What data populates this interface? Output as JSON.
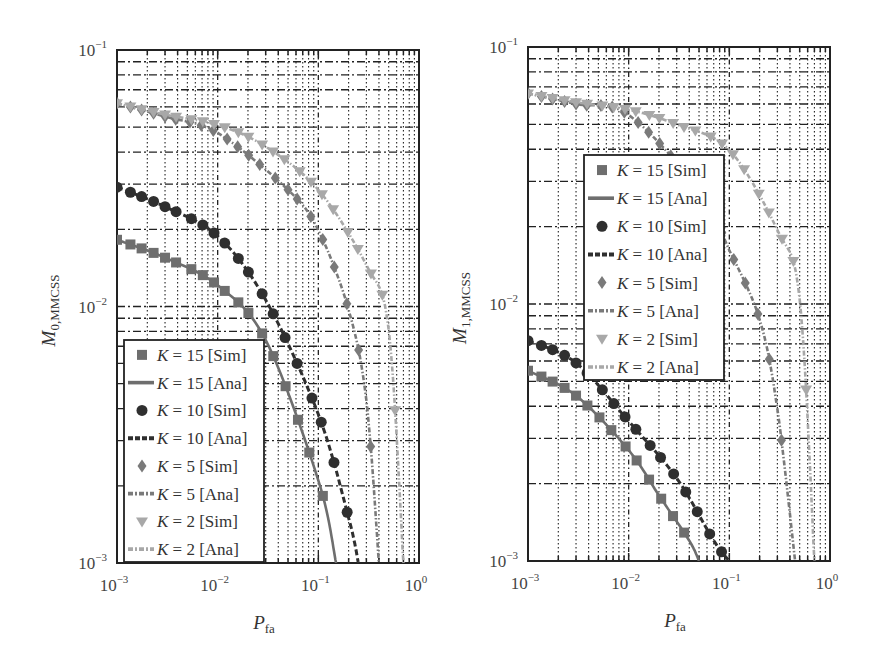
{
  "figure": {
    "panels": [
      {
        "id": "left",
        "ylabel_main": "M",
        "ylabel_sub": "0,MMCSS",
        "xlabel_main": "P",
        "xlabel_sub": "fa",
        "x_ticks": [
          {
            "base": "10",
            "exp": "−3"
          },
          {
            "base": "10",
            "exp": "−2"
          },
          {
            "base": "10",
            "exp": "−1"
          },
          {
            "base": "10",
            "exp": "0"
          }
        ],
        "y_ticks": [
          {
            "base": "10",
            "exp": "−1"
          },
          {
            "base": "10",
            "exp": "−2"
          },
          {
            "base": "10",
            "exp": "−3"
          }
        ]
      },
      {
        "id": "right",
        "ylabel_main": "M",
        "ylabel_sub": "1,MMCSS",
        "xlabel_main": "P",
        "xlabel_sub": "fa",
        "x_ticks": [
          {
            "base": "10",
            "exp": "−3"
          },
          {
            "base": "10",
            "exp": "−2"
          },
          {
            "base": "10",
            "exp": "−1"
          },
          {
            "base": "10",
            "exp": "0"
          }
        ],
        "y_ticks": [
          {
            "base": "10",
            "exp": "−1"
          },
          {
            "base": "10",
            "exp": "−2"
          },
          {
            "base": "10",
            "exp": "−3"
          }
        ]
      }
    ],
    "legend": [
      {
        "k": "K",
        "eq": " = 15 [Sim]",
        "marker": "square",
        "color": "#6e6e6e"
      },
      {
        "k": "K",
        "eq": " = 15 [Ana]",
        "line": "solid",
        "color": "#6e6e6e"
      },
      {
        "k": "K",
        "eq": " = 10 [Sim]",
        "marker": "circle",
        "color": "#2f2f2f"
      },
      {
        "k": "K",
        "eq": " = 10 [Ana]",
        "line": "dashed",
        "color": "#2f2f2f"
      },
      {
        "k": "K",
        "eq": " = 5 [Sim]",
        "marker": "diamond",
        "color": "#7a7a7a"
      },
      {
        "k": "K",
        "eq": " = 5 [Ana]",
        "line": "dashdot",
        "color": "#7a7a7a"
      },
      {
        "k": "K",
        "eq": " = 2 [Sim]",
        "marker": "triangle-down",
        "color": "#a8a8a8"
      },
      {
        "k": "K",
        "eq": " = 2 [Ana]",
        "line": "dashdot-light",
        "color": "#a8a8a8"
      }
    ]
  },
  "chart_data": [
    {
      "type": "line",
      "title": "",
      "xlabel": "P_fa",
      "ylabel": "M_0,MMCSS",
      "xscale": "log",
      "yscale": "log",
      "xlim": [
        0.001,
        1
      ],
      "ylim": [
        0.001,
        0.1
      ],
      "grid": true,
      "legend_position": "lower left",
      "series": [
        {
          "name": "K = 15 [Sim]/[Ana]",
          "x": [
            0.001,
            0.003,
            0.01,
            0.03,
            0.1,
            0.15
          ],
          "values": [
            0.0182,
            0.0155,
            0.0121,
            0.0074,
            0.0021,
            0.001
          ]
        },
        {
          "name": "K = 10 [Sim]/[Ana]",
          "x": [
            0.001,
            0.003,
            0.01,
            0.03,
            0.1,
            0.2,
            0.25
          ],
          "values": [
            0.0292,
            0.0245,
            0.0188,
            0.0106,
            0.0038,
            0.0015,
            0.001
          ]
        },
        {
          "name": "K = 5 [Sim]/[Ana]",
          "x": [
            0.001,
            0.003,
            0.01,
            0.05,
            0.1,
            0.2,
            0.3,
            0.4
          ],
          "values": [
            0.062,
            0.055,
            0.0475,
            0.0285,
            0.0198,
            0.0097,
            0.0043,
            0.001
          ]
        },
        {
          "name": "K = 2 [Sim]/[Ana]",
          "x": [
            0.001,
            0.003,
            0.01,
            0.03,
            0.1,
            0.3,
            0.5,
            0.7
          ],
          "values": [
            0.062,
            0.056,
            0.051,
            0.042,
            0.0285,
            0.0145,
            0.0081,
            0.001
          ]
        }
      ]
    },
    {
      "type": "line",
      "title": "",
      "xlabel": "P_fa",
      "ylabel": "M_1,MMCSS",
      "xscale": "log",
      "yscale": "log",
      "xlim": [
        0.001,
        1
      ],
      "ylim": [
        0.001,
        0.1
      ],
      "grid": true,
      "legend_position": "upper center",
      "series": [
        {
          "name": "K = 15 [Sim]/[Ana]",
          "x": [
            0.001,
            0.003,
            0.01,
            0.02,
            0.04,
            0.05
          ],
          "values": [
            0.0055,
            0.0044,
            0.0027,
            0.0018,
            0.0012,
            0.001
          ]
        },
        {
          "name": "K = 10 [Sim]/[Ana]",
          "x": [
            0.001,
            0.003,
            0.01,
            0.03,
            0.07,
            0.1
          ],
          "values": [
            0.0072,
            0.0059,
            0.0035,
            0.0021,
            0.0012,
            0.001
          ]
        },
        {
          "name": "K = 5 [Sim]/[Ana]",
          "x": [
            0.001,
            0.003,
            0.01,
            0.05,
            0.1,
            0.2,
            0.3,
            0.45
          ],
          "values": [
            0.066,
            0.06,
            0.0544,
            0.0277,
            0.0162,
            0.0087,
            0.0039,
            0.001
          ]
        },
        {
          "name": "K = 2 [Sim]/[Ana]",
          "x": [
            0.001,
            0.003,
            0.01,
            0.03,
            0.1,
            0.3,
            0.5,
            0.7
          ],
          "values": [
            0.066,
            0.061,
            0.057,
            0.05,
            0.0397,
            0.0194,
            0.0104,
            0.001
          ]
        }
      ]
    }
  ]
}
